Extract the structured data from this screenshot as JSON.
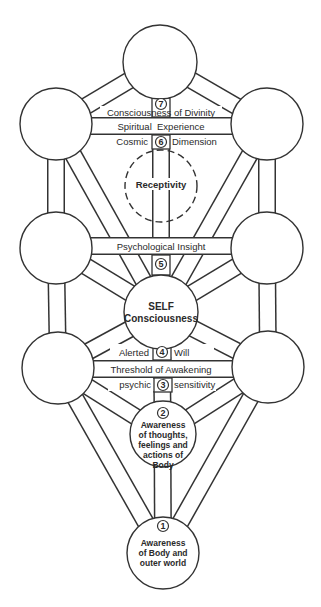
{
  "colors": {
    "line": "#333333",
    "background": "#ffffff",
    "text": "#2a2a2a"
  },
  "nodes": [
    {
      "id": "top",
      "cx": 160,
      "cy": 62,
      "r": 37,
      "lines": []
    },
    {
      "id": "upper-left",
      "cx": 56,
      "cy": 124,
      "r": 36,
      "lines": []
    },
    {
      "id": "upper-right",
      "cx": 267,
      "cy": 124,
      "r": 36,
      "lines": []
    },
    {
      "id": "receptivity",
      "cx": 161,
      "cy": 186,
      "r": 36,
      "dashed": true,
      "lines": [
        "Receptivity"
      ]
    },
    {
      "id": "middle-left",
      "cx": 56,
      "cy": 248,
      "r": 36,
      "lines": []
    },
    {
      "id": "middle-right",
      "cx": 267,
      "cy": 248,
      "r": 36,
      "lines": []
    },
    {
      "id": "self",
      "cx": 161,
      "cy": 312,
      "r": 37,
      "lines": [
        "SELF",
        "Consciousness"
      ]
    },
    {
      "id": "lower-left",
      "cx": 58,
      "cy": 368,
      "r": 36,
      "lines": []
    },
    {
      "id": "lower-right",
      "cx": 268,
      "cy": 367,
      "r": 36,
      "lines": []
    },
    {
      "id": "body-awareness",
      "cx": 163,
      "cy": 434,
      "r": 33,
      "number": "2",
      "lines": [
        "Awareness",
        "of thoughts,",
        "feelings and",
        "actions of",
        "Body"
      ]
    },
    {
      "id": "outer-world",
      "cx": 163,
      "cy": 553,
      "r": 36,
      "number": "1",
      "lines": [
        "Awareness",
        "of Body and",
        "outer world"
      ]
    }
  ],
  "bands": [
    {
      "label": "Spiritual  Experience",
      "y": 126
    },
    {
      "label": "Psychological Insight",
      "y": 246
    },
    {
      "label": "Threshold of Awakening",
      "y": 369
    }
  ],
  "level_labels": [
    {
      "number": "7",
      "left": "",
      "right": "",
      "text": "Consciousness of Divinity",
      "y": 113
    },
    {
      "number": "6",
      "left": "Cosmic",
      "right": "Dimension",
      "y": 142
    },
    {
      "number": "5",
      "left": "",
      "right": "",
      "y": 264
    },
    {
      "number": "4",
      "left": "Alerted",
      "right": "Will",
      "y": 352
    },
    {
      "number": "3",
      "left": "psychic",
      "right": "sensitivity",
      "y": 385
    }
  ],
  "texts": {
    "consciousness_of_divinity": "Consciousness of Divinity",
    "spiritual_experience": "Spiritual  Experience",
    "cosmic": "Cosmic",
    "dimension": "Dimension",
    "receptivity": "Receptivity",
    "psychological_insight": "Psychological Insight",
    "self": "SELF",
    "consciousness": "Consciousness",
    "alerted": "Alerted",
    "will": "Will",
    "threshold_of_awakening": "Threshold of Awakening",
    "psychic": "psychic",
    "sensitivity": "sensitivity",
    "n1": "1",
    "n2": "2",
    "n3": "3",
    "n4": "4",
    "n5": "5",
    "n6": "6",
    "n7": "7",
    "c2_l1": "Awareness",
    "c2_l2": "of thoughts,",
    "c2_l3": "feelings and",
    "c2_l4": "actions of",
    "c2_l5": "Body",
    "c1_l1": "Awareness",
    "c1_l2": "of Body and",
    "c1_l3": "outer world"
  }
}
